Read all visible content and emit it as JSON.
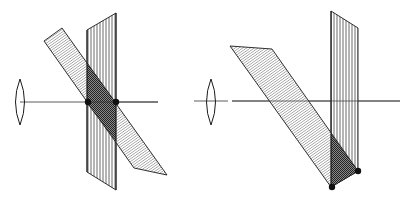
{
  "figure": {
    "colors": {
      "line": "#1a1a1a",
      "hatch": "#555555",
      "background": "#ffffff"
    },
    "panels": [
      {
        "id": "left",
        "lens": {
          "cx": 20,
          "cy": 102,
          "rx": 5,
          "ry": 23
        },
        "axis": {
          "x1": 20,
          "y1": 102,
          "x2": 158,
          "y2": 102
        },
        "vertical_plane": [
          [
            87,
            30
          ],
          [
            116,
            13
          ],
          [
            116,
            190
          ],
          [
            87,
            172
          ]
        ],
        "tilted_plane": [
          [
            44,
            41
          ],
          [
            62,
            28
          ],
          [
            167,
            175
          ],
          [
            134,
            168
          ]
        ],
        "overlap": [
          [
            87,
            65
          ],
          [
            116,
            103
          ],
          [
            116,
            140
          ],
          [
            87,
            103
          ]
        ],
        "points": [
          [
            88,
            102
          ],
          [
            116,
            102
          ]
        ]
      },
      {
        "id": "right",
        "lens": {
          "cx": 211,
          "cy": 102,
          "rx": 5,
          "ry": 23
        },
        "axis_segments": [
          [
            194,
            101,
            228,
            101
          ],
          [
            232,
            101,
            400,
            101
          ]
        ],
        "vertical_plane": [
          [
            331,
            11
          ],
          [
            358,
            28
          ],
          [
            358,
            171
          ],
          [
            331,
            187
          ]
        ],
        "tilted_plane": [
          [
            230,
            46
          ],
          [
            272,
            49
          ],
          [
            358,
            171
          ],
          [
            331,
            187
          ]
        ],
        "overlap": [
          [
            331,
            134
          ],
          [
            358,
            171
          ],
          [
            331,
            187
          ]
        ],
        "points": [
          [
            332,
            187
          ],
          [
            358,
            171
          ]
        ]
      }
    ]
  }
}
